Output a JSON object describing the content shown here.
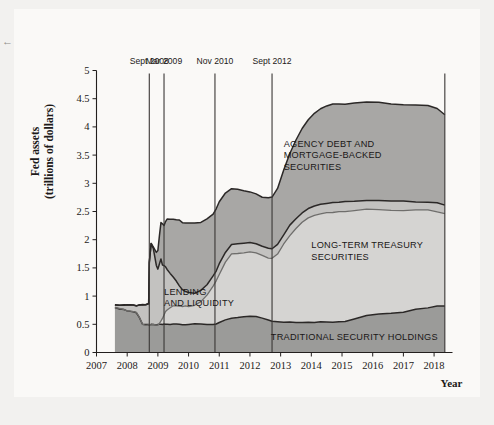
{
  "figure": {
    "background": "#f2f1ef",
    "plot_background": "#faf9f7",
    "corner_glyph": "←"
  },
  "chart_data": {
    "type": "area",
    "title": "",
    "subtitle": "",
    "xlabel": "Year",
    "ylabel": "Fed assets (trillions of dollars)",
    "ylabel_line1": "Fed assets",
    "ylabel_line2": "(trillions of dollars)",
    "stacked": true,
    "grid": false,
    "legend_position": "inline-annotations",
    "xlim": [
      2007,
      2018.6
    ],
    "ylim": [
      0,
      5
    ],
    "yticks": [
      0,
      0.5,
      1,
      1.5,
      2,
      2.5,
      3,
      3.5,
      4,
      4.5,
      5
    ],
    "ytick_labels": [
      "0",
      "0.5",
      "1",
      "1.5",
      "2",
      "2.5",
      "3",
      "3.5",
      "4",
      "4.5",
      "5"
    ],
    "xticks": [
      2007,
      2008,
      2009,
      2010,
      2011,
      2012,
      2013,
      2014,
      2015,
      2016,
      2017,
      2018
    ],
    "xtick_labels": [
      "2007",
      "2008",
      "2009",
      "2010",
      "2011",
      "2012",
      "2013",
      "2014",
      "2015",
      "2016",
      "2017",
      "2018"
    ],
    "x": [
      2007.6,
      2007.75,
      2007.9,
      2008.0,
      2008.1,
      2008.2,
      2008.3,
      2008.4,
      2008.5,
      2008.6,
      2008.7,
      2008.72,
      2008.78,
      2008.85,
      2008.95,
      2009.0,
      2009.05,
      2009.1,
      2009.15,
      2009.2,
      2009.25,
      2009.3,
      2009.4,
      2009.5,
      2009.6,
      2009.7,
      2009.8,
      2009.9,
      2010.0,
      2010.2,
      2010.4,
      2010.6,
      2010.8,
      2010.9,
      2011.0,
      2011.2,
      2011.4,
      2011.6,
      2011.8,
      2012.0,
      2012.2,
      2012.4,
      2012.6,
      2012.72,
      2012.9,
      2013.1,
      2013.3,
      2013.5,
      2013.7,
      2013.9,
      2014.1,
      2014.3,
      2014.5,
      2014.7,
      2014.9,
      2015.1,
      2015.4,
      2015.8,
      2016.2,
      2016.6,
      2017.0,
      2017.4,
      2017.8,
      2018.1,
      2018.35
    ],
    "series": [
      {
        "name": "TRADITIONAL SECURITY HOLDINGS",
        "order": 1,
        "color": "#9b9b99",
        "values": [
          0.79,
          0.78,
          0.76,
          0.74,
          0.73,
          0.72,
          0.71,
          0.62,
          0.5,
          0.49,
          0.49,
          0.49,
          0.49,
          0.49,
          0.49,
          0.49,
          0.5,
          0.5,
          0.5,
          0.5,
          0.5,
          0.5,
          0.5,
          0.51,
          0.51,
          0.5,
          0.5,
          0.5,
          0.5,
          0.5,
          0.5,
          0.5,
          0.5,
          0.51,
          0.53,
          0.57,
          0.6,
          0.62,
          0.63,
          0.64,
          0.63,
          0.61,
          0.58,
          0.55,
          0.54,
          0.54,
          0.54,
          0.54,
          0.54,
          0.54,
          0.54,
          0.54,
          0.54,
          0.54,
          0.54,
          0.55,
          0.6,
          0.66,
          0.69,
          0.7,
          0.72,
          0.76,
          0.8,
          0.83,
          0.83
        ]
      },
      {
        "name": "LONG-TERM TREASURY SECURITIES",
        "order": 2,
        "color": "#d5d4d2",
        "values": [
          0.0,
          0.0,
          0.0,
          0.0,
          0.0,
          0.0,
          0.0,
          0.0,
          0.0,
          0.0,
          0.0,
          0.0,
          0.0,
          0.0,
          0.0,
          0.0,
          0.02,
          0.05,
          0.1,
          0.16,
          0.22,
          0.26,
          0.29,
          0.31,
          0.32,
          0.32,
          0.32,
          0.32,
          0.32,
          0.34,
          0.4,
          0.52,
          0.68,
          0.76,
          0.86,
          1.03,
          1.14,
          1.14,
          1.14,
          1.14,
          1.13,
          1.11,
          1.1,
          1.12,
          1.2,
          1.38,
          1.54,
          1.66,
          1.76,
          1.84,
          1.89,
          1.92,
          1.94,
          1.95,
          1.95,
          1.95,
          1.92,
          1.88,
          1.84,
          1.82,
          1.8,
          1.76,
          1.72,
          1.67,
          1.63
        ]
      },
      {
        "name": "LENDING AND LIQUIDITY",
        "order": 3,
        "color": "#c3c2c0",
        "values": [
          0.06,
          0.06,
          0.08,
          0.1,
          0.11,
          0.12,
          0.12,
          0.22,
          0.35,
          0.36,
          0.37,
          1.1,
          1.45,
          1.35,
          1.05,
          0.98,
          1.05,
          1.1,
          0.95,
          0.88,
          0.8,
          0.72,
          0.62,
          0.52,
          0.43,
          0.36,
          0.3,
          0.26,
          0.24,
          0.22,
          0.2,
          0.19,
          0.18,
          0.18,
          0.18,
          0.17,
          0.17,
          0.17,
          0.17,
          0.17,
          0.17,
          0.17,
          0.17,
          0.17,
          0.17,
          0.17,
          0.17,
          0.17,
          0.17,
          0.17,
          0.17,
          0.17,
          0.17,
          0.17,
          0.17,
          0.17,
          0.16,
          0.16,
          0.16,
          0.16,
          0.16,
          0.15,
          0.15,
          0.15,
          0.15
        ]
      },
      {
        "name": "AGENCY DEBT AND MORTGAGE-BACKED SECURITIES",
        "order": 4,
        "color": "#a8a7a5",
        "values": [
          0.0,
          0.0,
          0.0,
          0.0,
          0.0,
          0.0,
          0.0,
          0.0,
          0.0,
          0.0,
          0.0,
          0.0,
          0.0,
          0.04,
          0.24,
          0.34,
          0.5,
          0.66,
          0.74,
          0.72,
          0.8,
          0.88,
          0.96,
          1.03,
          1.1,
          1.16,
          1.19,
          1.21,
          1.24,
          1.23,
          1.2,
          1.16,
          1.1,
          1.1,
          1.1,
          1.05,
          1.0,
          0.96,
          0.93,
          0.9,
          0.88,
          0.87,
          0.9,
          0.92,
          1.0,
          1.15,
          1.28,
          1.4,
          1.5,
          1.58,
          1.64,
          1.69,
          1.72,
          1.74,
          1.74,
          1.74,
          1.74,
          1.74,
          1.74,
          1.73,
          1.72,
          1.71,
          1.7,
          1.67,
          1.6
        ]
      }
    ],
    "annotations": [
      {
        "id": "agency",
        "text_lines": [
          "AGENCY DEBT AND",
          "MORTGAGE-BACKED",
          "SECURITIES"
        ],
        "x": 2013.1,
        "y": 3.65
      },
      {
        "id": "longterm",
        "text_lines": [
          "LONG-TERM TREASURY",
          "SECURITIES"
        ],
        "x": 2014.0,
        "y": 1.85
      },
      {
        "id": "lending",
        "text_lines": [
          "LENDING",
          "AND LIQUIDITY"
        ],
        "x": 2009.2,
        "y": 1.02
      },
      {
        "id": "traditional",
        "text_lines": [
          "TRADITIONAL SECURITY HOLDINGS"
        ],
        "x": 2015.4,
        "y": 0.23
      }
    ],
    "event_markers": [
      {
        "label": "Sept 2008",
        "x": 2008.72
      },
      {
        "label": "Mar 2009",
        "x": 2009.2
      },
      {
        "label": "Nov 2010",
        "x": 2010.86
      },
      {
        "label": "Sept 2012",
        "x": 2012.72
      },
      {
        "label": "",
        "x": 2018.35
      }
    ]
  }
}
